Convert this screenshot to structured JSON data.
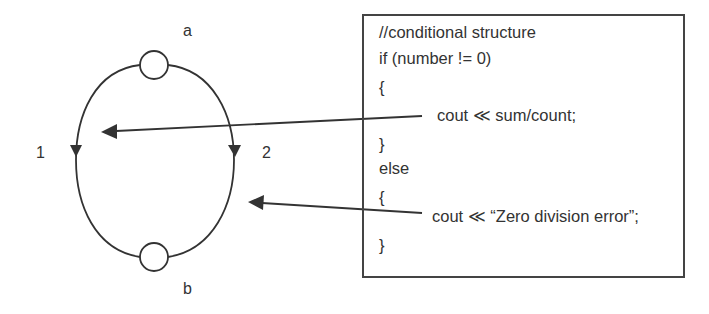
{
  "diagram": {
    "type": "control-flow-graph",
    "nodes": [
      {
        "id": "a",
        "label": "a"
      },
      {
        "id": "b",
        "label": "b"
      }
    ],
    "edges": [
      {
        "id": "1",
        "label": "1",
        "from": "a",
        "to": "b",
        "side": "left"
      },
      {
        "id": "2",
        "label": "2",
        "from": "a",
        "to": "b",
        "side": "right"
      }
    ],
    "colors": {
      "stroke": "#333333",
      "background": "#ffffff"
    }
  },
  "code": {
    "lines": [
      "//conditional structure",
      "if (number != 0)",
      "{",
      "cout ≪ sum/count;",
      "}",
      "else",
      "{",
      "cout ≪ “Zero division error”;",
      "}"
    ]
  },
  "mappings": [
    {
      "from_line": "cout ≪ sum/count;",
      "to_edge": "1"
    },
    {
      "from_line": "cout ≪ “Zero division error”;",
      "to_edge": "2"
    }
  ]
}
